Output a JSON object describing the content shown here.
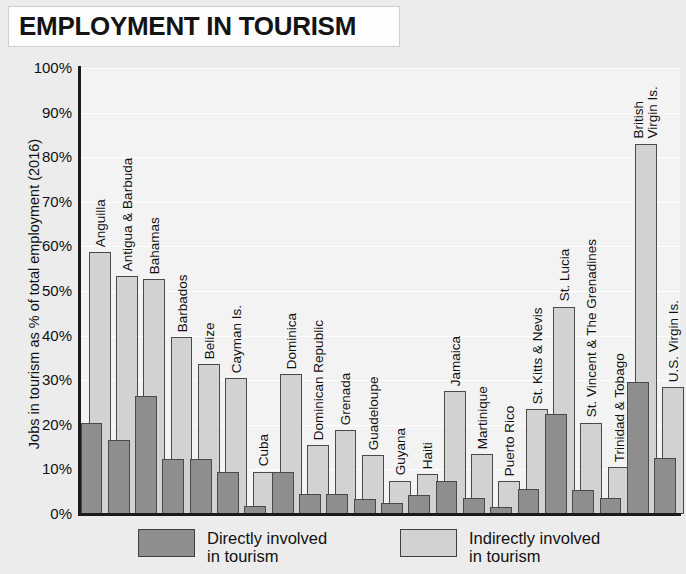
{
  "title": "EMPLOYMENT IN TOURISM",
  "legend": {
    "direct": {
      "label_line1": "Directly involved",
      "label_line2": "in tourism",
      "color": "#8e8e8e"
    },
    "indirect": {
      "label_line1": "Indirectly involved",
      "label_line2": "in tourism",
      "color": "#d2d2d2"
    }
  },
  "chart_data": {
    "type": "bar",
    "title": "EMPLOYMENT IN TOURISM",
    "xlabel": "",
    "ylabel": "Jobs in tourism as % of total employment (2016)",
    "ylim": [
      0,
      100
    ],
    "yticks": [
      "0%",
      "10%",
      "20%",
      "30%",
      "40%",
      "50%",
      "60%",
      "70%",
      "80%",
      "90%",
      "100%"
    ],
    "grid": true,
    "legend_position": "bottom",
    "overlap": true,
    "categories": [
      "Anguilla",
      "Antigua & Barbuda",
      "Bahamas",
      "Barbados",
      "Belize",
      "Cayman Is.",
      "Cuba",
      "Dominica",
      "Dominican Republic",
      "Grenada",
      "Guadeloupe",
      "Guyana",
      "Haiti",
      "Jamaica",
      "Martinique",
      "Puerto Rico",
      "St. Kitts & Nevis",
      "St. Lucia",
      "St. Vincent & The Grenadines",
      "Trinidad & Tobago",
      "British Virgin Is.",
      "U.S. Virgin Is."
    ],
    "series": [
      {
        "name": "Indirectly involved in tourism",
        "color": "#d2d2d2",
        "values": [
          58.8,
          53.4,
          52.7,
          39.6,
          33.6,
          30.5,
          9.5,
          31.4,
          15.5,
          18.8,
          13.3,
          7.5,
          9.0,
          27.5,
          13.5,
          7.3,
          23.5,
          46.5,
          20.5,
          10.5,
          83.0,
          28.5
        ]
      },
      {
        "name": "Directly involved in tourism",
        "color": "#8e8e8e",
        "values": [
          20.5,
          16.5,
          26.5,
          12.3,
          12.3,
          9.5,
          1.7,
          9.4,
          4.5,
          4.5,
          3.4,
          2.5,
          4.2,
          7.3,
          3.6,
          1.6,
          5.5,
          22.5,
          5.4,
          3.5,
          29.5,
          12.5
        ]
      }
    ]
  }
}
